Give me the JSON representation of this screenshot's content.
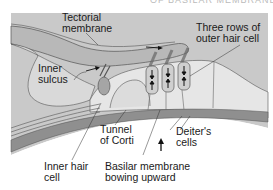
{
  "heading": "OF BASILAR MEMBRANE",
  "labels": {
    "tectorial": "Tectorial\nmembrane",
    "inner_sulcus": "Inner\nsulcus",
    "outer_hair": "Three rows of\nouter hair cell",
    "tunnel": "Tunnel\nof Corti",
    "deiter": "Deiter's\ncells",
    "inner_hair": "Inner hair\ncell",
    "basilar": "Basilar membrane\nbowing upward"
  },
  "colors": {
    "background_panel": "#c9c9c9",
    "tectorial_fill": "#b8b8b8",
    "tissue_light": "#e6e6e6",
    "basilar_dark": "#8f8f8f",
    "hair_cell": "#a5a5a5",
    "line": "#3a3a3a"
  }
}
